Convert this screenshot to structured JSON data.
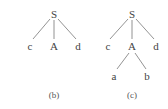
{
  "trees": [
    {
      "caption": "(b)",
      "nodes": {
        "root": "S",
        "left": "c",
        "mid": "A",
        "right": "d"
      }
    },
    {
      "caption": "(c)",
      "nodes": {
        "root": "S",
        "left": "c",
        "mid": "A",
        "right": "d",
        "child_left": "a",
        "child_right": "b"
      }
    }
  ]
}
